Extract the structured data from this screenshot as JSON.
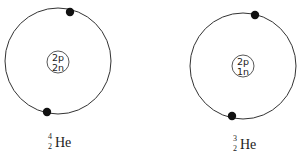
{
  "atoms": [
    {
      "name": "helium-4",
      "nucleus": {
        "protons": "2p",
        "neutrons": "2n"
      },
      "electrons": 2,
      "label": {
        "mass_number": "4",
        "atomic_number": "2",
        "symbol": "He"
      }
    },
    {
      "name": "helium-3",
      "nucleus": {
        "protons": "2p",
        "neutrons": "1n"
      },
      "electrons": 2,
      "label": {
        "mass_number": "3",
        "atomic_number": "2",
        "symbol": "He"
      }
    }
  ]
}
